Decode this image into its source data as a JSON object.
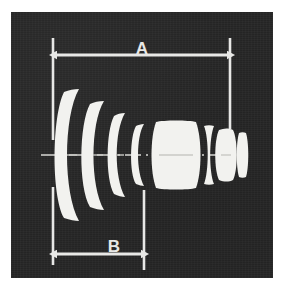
{
  "figure": {
    "kind": "optical-lens-cross-section-diagram",
    "background_color": "#ffffff",
    "panel_color": "#272727",
    "ink_color": "#e8e8e6"
  },
  "dimensions": {
    "overall": {
      "label": "A",
      "arrow_style": "double-headed",
      "position": "top",
      "description": "overall lens length"
    },
    "front_group": {
      "label": "B",
      "arrow_style": "double-headed",
      "position": "bottom",
      "description": "front group length"
    }
  },
  "axis": {
    "name": "optical-axis",
    "style": "dash-dot"
  },
  "elements": [
    {
      "id": 1,
      "name": "front-negative-meniscus",
      "shape": "meniscus-concave-right"
    },
    {
      "id": 2,
      "name": "second-negative-meniscus",
      "shape": "meniscus-concave-right"
    },
    {
      "id": 3,
      "name": "third-negative-meniscus",
      "shape": "meniscus-concave-right"
    },
    {
      "id": 4,
      "name": "thin-meniscus",
      "shape": "thin-meniscus"
    },
    {
      "id": 5,
      "name": "thick-biconvex",
      "shape": "biconvex-thick"
    },
    {
      "id": 6,
      "name": "biconcave",
      "shape": "biconcave"
    },
    {
      "id": 7,
      "name": "rear-biconvex",
      "shape": "biconvex"
    },
    {
      "id": 8,
      "name": "rear-thin-biconvex",
      "shape": "biconvex-thin"
    }
  ]
}
